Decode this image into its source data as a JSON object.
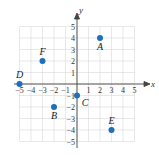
{
  "chart_data": {
    "type": "scatter",
    "title": "",
    "xlabel": "x",
    "ylabel": "y",
    "xlim": [
      -5,
      5
    ],
    "ylim": [
      -5,
      5
    ],
    "grid": true,
    "x_ticks": [
      "-5",
      "-4",
      "-3",
      "-2",
      "-1",
      "1",
      "2",
      "3",
      "4",
      "5"
    ],
    "y_ticks": [
      "5",
      "4",
      "3",
      "2",
      "1",
      "-1",
      "-2",
      "-3",
      "-4",
      "-5"
    ],
    "points": [
      {
        "label": "A",
        "x": 2,
        "y": 4
      },
      {
        "label": "B",
        "x": -2,
        "y": -2
      },
      {
        "label": "C",
        "x": 0,
        "y": -1
      },
      {
        "label": "D",
        "x": -5,
        "y": 0
      },
      {
        "label": "E",
        "x": 3,
        "y": -4
      },
      {
        "label": "F",
        "x": -3,
        "y": 2
      }
    ],
    "point_color": "#1f6fba"
  }
}
